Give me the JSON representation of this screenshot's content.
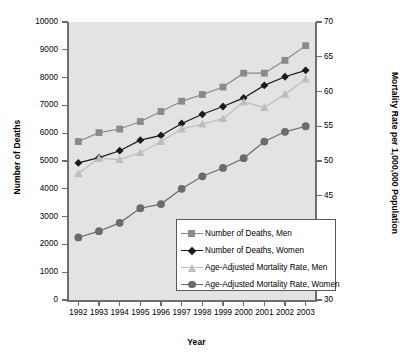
{
  "chart_data": {
    "type": "line",
    "title": "",
    "xlabel": "Year",
    "ylabel": "Number of Deaths",
    "y2label": "Mortality Rate per 1,000,000 Population",
    "categories": [
      "1992",
      "1993",
      "1994",
      "1995",
      "1996",
      "1997",
      "1998",
      "1999",
      "2000",
      "2001",
      "2002",
      "2003"
    ],
    "ylim": [
      0,
      10000
    ],
    "y2lim": [
      30,
      70
    ],
    "yticks": [
      "0",
      "1000",
      "2000",
      "3000",
      "4000",
      "5000",
      "6000",
      "7000",
      "8000",
      "9000",
      "10000"
    ],
    "y2ticks": [
      "30",
      "35",
      "40",
      "45",
      "50",
      "55",
      "60",
      "65",
      "70"
    ],
    "grid": false,
    "legend_position": "inside-bottom-right",
    "plot_background": "#e3e3e3",
    "series": [
      {
        "name": "Number of Deaths, Men",
        "axis": "left",
        "marker": "square",
        "color": "#8a8a8a",
        "values": [
          5700,
          6020,
          6150,
          6420,
          6780,
          7150,
          7390,
          7660,
          8160,
          8160,
          8620,
          9150
        ]
      },
      {
        "name": "Number of Deaths, Women",
        "axis": "left",
        "marker": "diamond",
        "color": "#1a1a1a",
        "values": [
          4930,
          5120,
          5370,
          5750,
          5920,
          6350,
          6680,
          6960,
          7270,
          7720,
          8030,
          8260
        ]
      },
      {
        "name": "Age-Adjusted Mortality Rate, Men",
        "axis": "right",
        "marker": "triangle",
        "color": "#bdbdbd",
        "values": [
          48.2,
          50.4,
          50.2,
          51.2,
          52.8,
          54.6,
          55.3,
          56.1,
          58.5,
          57.7,
          59.6,
          61.8
        ]
      },
      {
        "name": "Age-Adjusted Mortality Rate, Women",
        "axis": "right",
        "marker": "circle",
        "color": "#6b6b6b",
        "values": [
          39.0,
          39.9,
          41.1,
          43.2,
          43.8,
          46.0,
          47.8,
          49.0,
          50.4,
          52.8,
          54.2,
          55.0
        ]
      }
    ]
  },
  "legend": {
    "items": [
      {
        "label": "Number of Deaths, Men"
      },
      {
        "label": "Number of Deaths, Women"
      },
      {
        "label": "Age-Adjusted Mortality Rate, Men"
      },
      {
        "label": "Age-Adjusted Mortality Rate, Women"
      }
    ]
  }
}
